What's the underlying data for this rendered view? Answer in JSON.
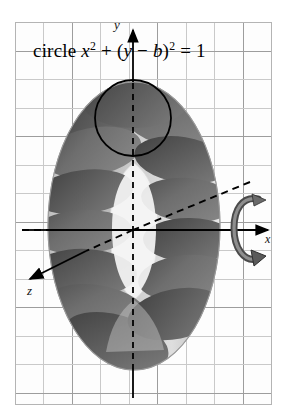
{
  "figure": {
    "title_equation": "circle x² + (y − b)² = 1",
    "equation_parts": {
      "word": "circle",
      "var_x": "x",
      "exp_1": "2",
      "plus": "+",
      "open_paren": "(",
      "var_y": "y",
      "minus": "−",
      "var_b": "b",
      "close_paren": ")",
      "exp_2": "2",
      "equals": "=",
      "rhs": "1"
    },
    "surface_name": "torus"
  },
  "axes": {
    "y_label": "y",
    "x_label": "x",
    "z_label": "z",
    "origin": {
      "x": 133,
      "y": 230
    },
    "x_axis": {
      "from_x": 22,
      "to_x": 272,
      "y": 230,
      "arrow": "right"
    },
    "y_axis": {
      "x": 133,
      "from_y": 398,
      "to_y": 26,
      "arrow": "up"
    },
    "z_axis": {
      "from_x": 250,
      "from_y": 182,
      "to_x": 24,
      "to_y": 283,
      "arrow": "down-left"
    }
  },
  "rotation_indicator": {
    "name": "rotation-arrow",
    "meaning": "revolve about x-axis",
    "position": {
      "x": 246,
      "y": 203
    }
  },
  "generating_circle": {
    "center": {
      "x": 133,
      "y": 118
    },
    "radius": 38,
    "stroke": "#000000"
  },
  "torus": {
    "center": {
      "x": 134,
      "y": 226
    },
    "outer_rx": 86,
    "outer_ry": 144,
    "slice_count": 12,
    "shell_color": "#c2c2c2",
    "slice_color": "#6f6f6f",
    "slice_dark_color": "#555555",
    "highlight_color": "#e8e8e8"
  },
  "grid": {
    "left": 15,
    "top": 22,
    "width": 257,
    "height": 383,
    "cell_size": 28.5,
    "line_color": "#c9c9c9",
    "strong_line_color": "#9d9d9d",
    "border_color": "#b4b4b4"
  },
  "colors": {
    "ink": "#000000",
    "paper": "#ffffff",
    "grid": "#c9c9c9"
  }
}
